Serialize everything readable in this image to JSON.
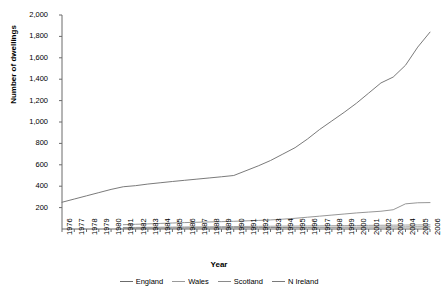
{
  "chart_data": {
    "type": "line",
    "title": "",
    "xlabel": "Year",
    "ylabel": "Number of dwellings",
    "xlim": [
      1976,
      2006
    ],
    "ylim": [
      0,
      2000
    ],
    "ytick_step": 200,
    "grid": false,
    "legend_position": "bottom",
    "ytick_labels": [
      "2,000",
      "1,800",
      "1,600",
      "1,400",
      "1,200",
      "1,000",
      "800",
      "600",
      "400",
      "200"
    ],
    "ytick_values": [
      2000,
      1800,
      1600,
      1400,
      1200,
      1000,
      800,
      600,
      400,
      200
    ],
    "x": [
      1976,
      1977,
      1978,
      1979,
      1980,
      1981,
      1982,
      1983,
      1984,
      1985,
      1986,
      1987,
      1988,
      1989,
      1990,
      1991,
      1992,
      1993,
      1994,
      1995,
      1996,
      1997,
      1998,
      1999,
      2000,
      2001,
      2002,
      2003,
      2004,
      2005,
      2006
    ],
    "categories": [
      "1976",
      "1977",
      "1978",
      "1979",
      "1980",
      "1981",
      "1982",
      "1983",
      "1984",
      "1985",
      "1986",
      "1987",
      "1988",
      "1989",
      "1990",
      "1991",
      "1992",
      "1993",
      "1994",
      "1995",
      "1996",
      "1997",
      "1998",
      "1999",
      "2000",
      "2001",
      "2002",
      "2003",
      "2004",
      "2005",
      "2006"
    ],
    "series": [
      {
        "name": "England",
        "color": "#6b6b6b",
        "x": [
          1976,
          1977,
          1978,
          1979,
          1980,
          1981,
          1982,
          1983,
          1984,
          1985,
          1986,
          1987,
          1988,
          1989,
          1990,
          1991,
          1992,
          1993,
          1994,
          1995,
          1996,
          1997,
          1998,
          1999,
          2000,
          2001,
          2002,
          2003,
          2004,
          2005,
          2006
        ],
        "values": [
          250,
          280,
          310,
          340,
          370,
          395,
          405,
          420,
          432,
          444,
          455,
          466,
          477,
          488,
          500,
          545,
          590,
          640,
          700,
          760,
          840,
          930,
          1010,
          1090,
          1175,
          1270,
          1365,
          1420,
          1530,
          1700,
          1840
        ]
      },
      {
        "name": "Wales",
        "color": "#9a9a9a",
        "x": [
          1981,
          1982,
          1983,
          1984,
          1985,
          1986,
          1987,
          1988,
          1989,
          1990,
          1991,
          1992,
          1993,
          1994,
          1995,
          1996,
          1997,
          1998,
          1999,
          2000,
          2001,
          2002,
          2003,
          2004,
          2005,
          2006
        ],
        "values": [
          14,
          15,
          16,
          17,
          18,
          19,
          20,
          21,
          22,
          23,
          24,
          25,
          26,
          27,
          28,
          29,
          30,
          31,
          32,
          33,
          34,
          35,
          36,
          37,
          38,
          39
        ]
      },
      {
        "name": "Scotland",
        "color": "#8a8a8a",
        "x": [
          1981,
          1982,
          1983,
          1984,
          1985,
          1986,
          1987,
          1988,
          1989,
          1990,
          1991,
          1992,
          1993,
          1994,
          1995,
          1996,
          1997,
          1998,
          1999,
          2000,
          2001,
          2002,
          2003,
          2004,
          2005,
          2006
        ],
        "values": [
          40,
          44,
          48,
          52,
          56,
          60,
          63,
          66,
          69,
          72,
          76,
          80,
          85,
          92,
          100,
          110,
          120,
          130,
          140,
          150,
          158,
          166,
          180,
          235,
          245,
          247
        ]
      },
      {
        "name": "N Ireland",
        "color": "#7a7a7a",
        "x": [
          1981,
          1982,
          1983,
          1984,
          1985,
          1986,
          1987,
          1988,
          1989,
          1990,
          1991,
          1992,
          1993,
          1994,
          1995,
          1996,
          1997,
          1998,
          1999,
          2000,
          2001,
          2002,
          2003,
          2004,
          2005,
          2006
        ],
        "values": [
          8,
          8,
          9,
          9,
          10,
          10,
          11,
          11,
          12,
          12,
          13,
          13,
          14,
          14,
          15,
          15,
          16,
          16,
          17,
          17,
          18,
          18,
          19,
          19,
          20,
          20
        ]
      }
    ]
  },
  "legend": {
    "items": [
      {
        "label": "England"
      },
      {
        "label": "Wales"
      },
      {
        "label": "Scotland"
      },
      {
        "label": "N Ireland"
      }
    ]
  },
  "axes": {
    "x_title": "Year",
    "y_title": "Number of dwellings"
  }
}
